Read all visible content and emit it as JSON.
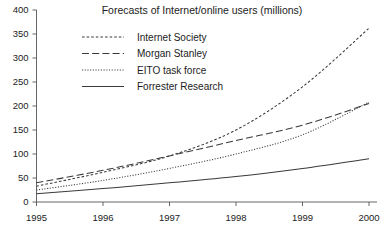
{
  "chart_data": {
    "type": "line",
    "title": "Forecasts of Internet/online users (millions)",
    "xlabel": "",
    "ylabel": "",
    "xlim": [
      1995,
      2000
    ],
    "ylim": [
      0,
      400
    ],
    "grid": false,
    "legend_position": "top-left-inside",
    "x": [
      1995,
      1996,
      1997,
      1998,
      1999,
      2000
    ],
    "x_tick_labels": [
      "1995",
      "1996",
      "1997",
      "1998",
      "1999",
      "2000"
    ],
    "y_ticks": [
      0,
      50,
      100,
      150,
      200,
      250,
      300,
      350,
      400
    ],
    "y_tick_labels": [
      "0",
      "50",
      "100",
      "150",
      "200",
      "250",
      "300",
      "350",
      "400"
    ],
    "series": [
      {
        "name": "Internet Society",
        "style": "short-dash",
        "values": [
          33,
          62,
          96,
          150,
          240,
          362
        ]
      },
      {
        "name": "Morgan Stanley",
        "style": "long-dash",
        "values": [
          40,
          66,
          96,
          128,
          160,
          205
        ]
      },
      {
        "name": "EITO task force",
        "style": "dotted",
        "values": [
          25,
          45,
          70,
          100,
          140,
          208
        ]
      },
      {
        "name": "Forrester Research",
        "style": "solid",
        "values": [
          17,
          28,
          40,
          53,
          70,
          90
        ]
      }
    ]
  },
  "legend": {
    "entries": [
      {
        "label": "Internet Society"
      },
      {
        "label": "Morgan Stanley"
      },
      {
        "label": "EITO task force"
      },
      {
        "label": "Forrester Research"
      }
    ]
  },
  "colors": {
    "background": "#ffffff",
    "axis": "#555555",
    "line": "#3a3a3a",
    "text": "#1c1c1c"
  }
}
